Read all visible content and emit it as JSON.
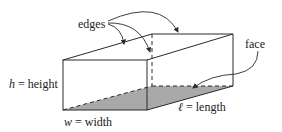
{
  "diagram": {
    "labels": {
      "edges": "edges",
      "face": "face",
      "height_var": "h",
      "height_rest": " = height",
      "width_var": "w",
      "width_rest": " = width",
      "length_var": "ℓ",
      "length_rest": " = length"
    },
    "colors": {
      "stroke": "#2a2a2a",
      "shaded_face": "#a9a9a9",
      "background": "#ffffff"
    }
  }
}
